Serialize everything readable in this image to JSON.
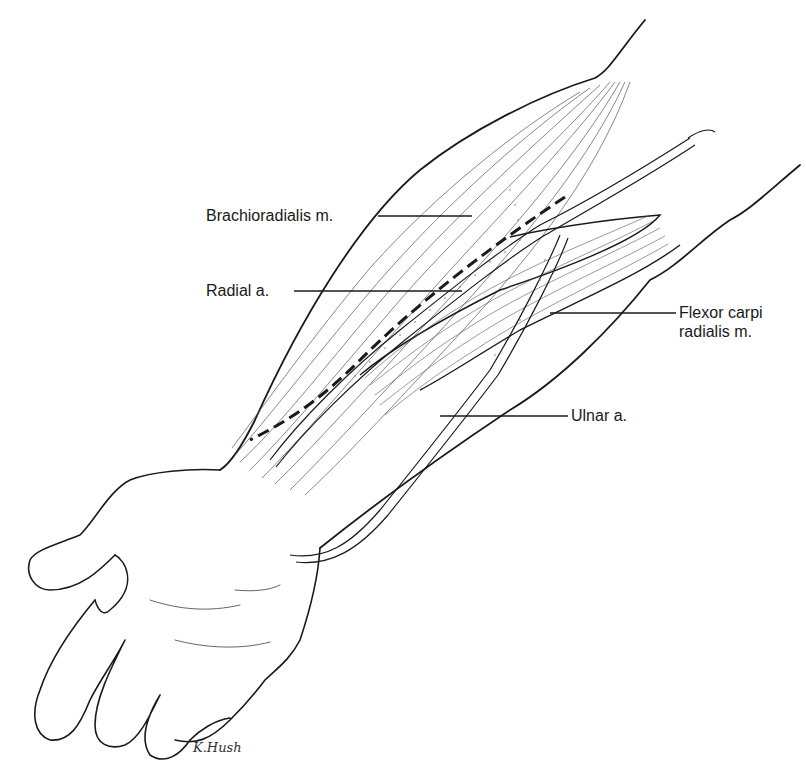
{
  "figure": {
    "labels": {
      "brachioradialis": "Brachioradialis m.",
      "radial_artery": "Radial a.",
      "fcr_line1": "Flexor carpi",
      "fcr_line2": "radialis m.",
      "ulnar_artery": "Ulnar a."
    },
    "signature": "K.Hush",
    "colors": {
      "ink": "#1a1a1a",
      "fiber": "#555555",
      "stipple": "#777777",
      "background": "#ffffff"
    }
  }
}
